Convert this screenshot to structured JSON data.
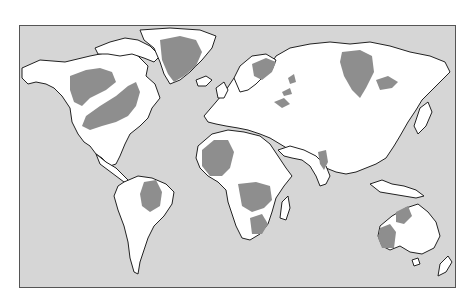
{
  "map": {
    "type": "world-map",
    "projection": "equirectangular-like",
    "colors": {
      "ocean": "#d6d6d6",
      "land": "#ffffff",
      "highlight": "#8e8e8e",
      "outline": "#222222",
      "frame": "#555555"
    },
    "highlighted_regions": [
      "Western Canada",
      "Hudson Bay / Eastern Canada",
      "Greenland",
      "Scandinavia",
      "Western Russia",
      "Central Siberia",
      "Eastern Siberia",
      "Caspian region",
      "Western Africa",
      "Central Africa",
      "East Africa",
      "Southern Africa",
      "India",
      "Northern South America",
      "Western Australia",
      "Northern Australia"
    ]
  }
}
